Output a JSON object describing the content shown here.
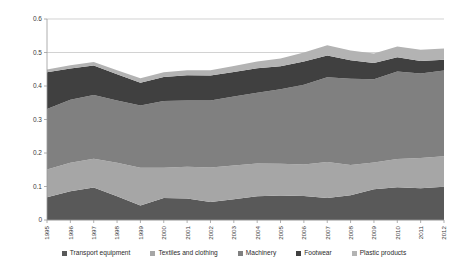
{
  "chart_data": {
    "type": "area",
    "stacked": true,
    "title": "",
    "subtitle": "",
    "xlabel": "",
    "ylabel": "",
    "ylim": [
      0,
      0.6
    ],
    "yticks": [
      "0",
      "0.1",
      "0.2",
      "0.3",
      "0.4",
      "0.5",
      "0.6"
    ],
    "ytick_values": [
      0,
      0.1,
      0.2,
      0.3,
      0.4,
      0.5,
      0.6
    ],
    "grid": true,
    "grid_axis": "y",
    "legend_position": "bottom",
    "categories": [
      "1995",
      "1996",
      "1997",
      "1998",
      "1999",
      "2000",
      "2001",
      "2002",
      "2003",
      "2004",
      "2005",
      "2006",
      "2007",
      "2008",
      "2009",
      "2010",
      "2011",
      "2012"
    ],
    "series": [
      {
        "name": "Transport equipment",
        "color": "#595959",
        "values": [
          0.068,
          0.086,
          0.097,
          0.071,
          0.043,
          0.066,
          0.064,
          0.054,
          0.062,
          0.071,
          0.073,
          0.072,
          0.066,
          0.074,
          0.092,
          0.098,
          0.095,
          0.099
        ]
      },
      {
        "name": "Textiles and clothing",
        "color": "#a6a6a6",
        "values": [
          0.083,
          0.085,
          0.086,
          0.1,
          0.113,
          0.09,
          0.095,
          0.103,
          0.101,
          0.098,
          0.095,
          0.094,
          0.107,
          0.09,
          0.08,
          0.084,
          0.09,
          0.091
        ]
      },
      {
        "name": "Machinery",
        "color": "#808080",
        "values": [
          0.18,
          0.188,
          0.19,
          0.186,
          0.186,
          0.199,
          0.198,
          0.2,
          0.206,
          0.211,
          0.222,
          0.238,
          0.253,
          0.258,
          0.248,
          0.261,
          0.252,
          0.256
        ]
      },
      {
        "name": "Footwear",
        "color": "#404040",
        "values": [
          0.11,
          0.093,
          0.088,
          0.078,
          0.068,
          0.072,
          0.075,
          0.074,
          0.073,
          0.073,
          0.069,
          0.069,
          0.065,
          0.055,
          0.049,
          0.043,
          0.038,
          0.032
        ]
      },
      {
        "name": "Plastic products",
        "color": "#b3b3b3",
        "values": [
          0.008,
          0.01,
          0.011,
          0.012,
          0.013,
          0.014,
          0.015,
          0.016,
          0.018,
          0.02,
          0.023,
          0.027,
          0.031,
          0.029,
          0.028,
          0.032,
          0.033,
          0.034
        ]
      }
    ]
  },
  "legend": {
    "items": [
      {
        "label": "Transport equipment"
      },
      {
        "label": "Textiles and clothing"
      },
      {
        "label": "Machinery"
      },
      {
        "label": "Footwear"
      },
      {
        "label": "Plastic products"
      }
    ]
  }
}
